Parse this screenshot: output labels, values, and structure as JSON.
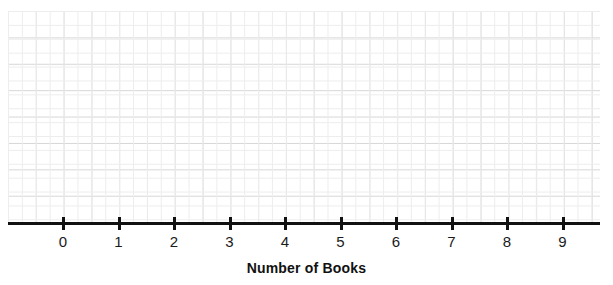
{
  "chart_data": {
    "type": "bar",
    "title": "",
    "subtitle": "",
    "xlabel": "Number of Books",
    "ylabel": "",
    "categories": [
      "0",
      "1",
      "2",
      "3",
      "4",
      "5",
      "6",
      "7",
      "8",
      "9"
    ],
    "values": [
      0,
      0,
      0,
      0,
      0,
      0,
      0,
      0,
      0,
      0
    ],
    "series": [
      {
        "name": "",
        "values": [
          0,
          0,
          0,
          0,
          0,
          0,
          0,
          0,
          0,
          0
        ]
      }
    ],
    "xlim": [
      -1,
      10
    ],
    "ylim": [
      0,
      8
    ],
    "grid": true,
    "legend": false,
    "legend_position": "none",
    "annotations": []
  },
  "axis": {
    "title": "Number of Books",
    "tick_labels": [
      "0",
      "1",
      "2",
      "3",
      "4",
      "5",
      "6",
      "7",
      "8",
      "9"
    ],
    "tick_positions_px": [
      63,
      118.5,
      174,
      229.5,
      285,
      340.5,
      396,
      451.5,
      507,
      562.5
    ],
    "line_color": "#111111",
    "label_color": "#1a1a1a"
  },
  "grid": {
    "major_color": "#d6d6d6",
    "minor_color": "#ededed",
    "major_cell_width_px": 27.8,
    "major_cell_height_px": 26.4,
    "background": "#ffffff",
    "columns": 21,
    "rows": 8
  }
}
